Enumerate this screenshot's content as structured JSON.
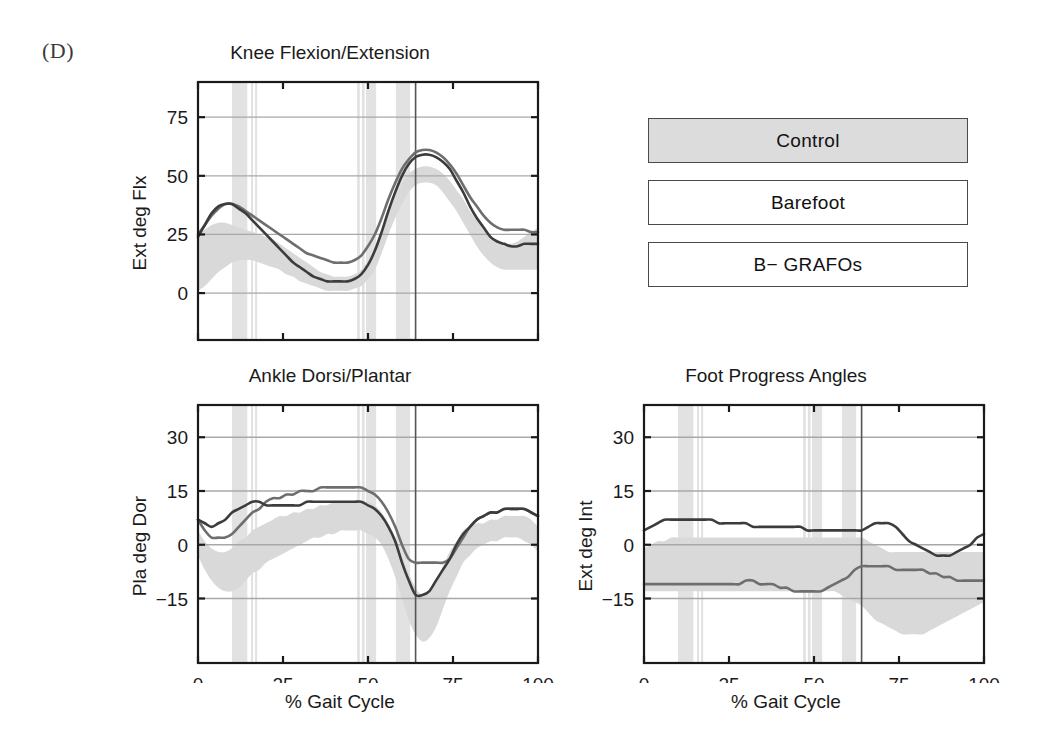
{
  "figure": {
    "panel_label": "(D)",
    "background": "#ffffff"
  },
  "legend": {
    "items": [
      {
        "label": "Control",
        "fill": "#dcdcdc",
        "border": "#4a4a4a"
      },
      {
        "label": "Barefoot",
        "fill": "#ffffff",
        "border": "#4a4a4a"
      },
      {
        "label": "B− GRAFOs",
        "fill": "#ffffff",
        "border": "#4a4a4a"
      }
    ]
  },
  "colors": {
    "band": "#d9d9d9",
    "event_band": "#e2e2e2",
    "series_barefoot": "#6e6e6e",
    "series_grafos": "#3c3c3c",
    "gridline": "#a8a8a8",
    "axis": "#1a1a1a",
    "toe_off_line": "#555555"
  },
  "chart_data": [
    {
      "id": "knee",
      "type": "line",
      "title": "Knee Flexion/Extension",
      "xlabel": "",
      "ylabel": "Ext   deg   Flx",
      "xlim": [
        0,
        100
      ],
      "ylim": [
        -20,
        90
      ],
      "yticks": [
        0,
        25,
        50,
        75
      ],
      "ytick_labels": [
        "0",
        "25",
        "50",
        "75"
      ],
      "xticks": [
        0,
        25,
        50,
        75,
        100
      ],
      "xtick_labels": [
        "",
        "",
        "",
        "",
        ""
      ],
      "grid": true,
      "legend_position": "external",
      "toe_off": 64,
      "event_bands": [
        {
          "from": 10.0,
          "to": 14.5
        },
        {
          "from": 15.6,
          "to": 16.2
        },
        {
          "from": 16.8,
          "to": 17.4
        },
        {
          "from": 46.8,
          "to": 47.6
        },
        {
          "from": 48.2,
          "to": 49.0
        },
        {
          "from": 49.4,
          "to": 52.4
        },
        {
          "from": 58.2,
          "to": 62.4
        }
      ],
      "x": [
        0,
        2,
        4,
        6,
        8,
        10,
        12,
        14,
        16,
        18,
        20,
        22,
        24,
        26,
        28,
        30,
        32,
        34,
        36,
        38,
        40,
        42,
        44,
        46,
        48,
        50,
        52,
        54,
        56,
        58,
        60,
        62,
        64,
        66,
        68,
        70,
        72,
        74,
        76,
        78,
        80,
        82,
        84,
        86,
        88,
        90,
        92,
        94,
        96,
        98,
        100
      ],
      "series": [
        {
          "name": "Control",
          "kind": "band",
          "upper": [
            25,
            27,
            29,
            30,
            30,
            29,
            28,
            27,
            26,
            25,
            24,
            23,
            21,
            19,
            17,
            15,
            13,
            11,
            9,
            8,
            7,
            7,
            7,
            8,
            10,
            14,
            19,
            26,
            34,
            41,
            47,
            51,
            53,
            54,
            54,
            53,
            51,
            48,
            44,
            40,
            35,
            31,
            27,
            24,
            22,
            21,
            21,
            22,
            24,
            26,
            28
          ],
          "lower": [
            1,
            3,
            6,
            9,
            11,
            13,
            14,
            14,
            14,
            13,
            12,
            11,
            10,
            8,
            7,
            5,
            4,
            3,
            2,
            1,
            1,
            1,
            1,
            2,
            3,
            6,
            10,
            17,
            25,
            32,
            38,
            43,
            46,
            47,
            47,
            46,
            43,
            39,
            35,
            30,
            25,
            20,
            16,
            13,
            11,
            10,
            10,
            10,
            10,
            10,
            10
          ]
        },
        {
          "name": "Barefoot",
          "kind": "line",
          "values": [
            25,
            29,
            33,
            36,
            38,
            38,
            37,
            35,
            33,
            31,
            29,
            27,
            25,
            23,
            21,
            19,
            17,
            16,
            15,
            14,
            13,
            13,
            13,
            14,
            16,
            20,
            25,
            32,
            40,
            47,
            53,
            57,
            60,
            61,
            61,
            60,
            58,
            55,
            51,
            46,
            41,
            37,
            33,
            30,
            28,
            27,
            27,
            27,
            27,
            26,
            26
          ]
        },
        {
          "name": "B− GRAFOs",
          "kind": "line",
          "values": [
            24,
            29,
            34,
            37,
            38,
            38,
            36,
            34,
            31,
            28,
            25,
            22,
            19,
            16,
            13,
            11,
            9,
            7,
            6,
            5,
            5,
            5,
            5,
            6,
            8,
            12,
            18,
            26,
            35,
            43,
            50,
            55,
            58,
            59,
            59,
            58,
            56,
            53,
            48,
            43,
            37,
            32,
            28,
            24,
            22,
            21,
            20,
            20,
            21,
            21,
            21
          ]
        }
      ]
    },
    {
      "id": "ankle",
      "type": "line",
      "title": "Ankle Dorsi/Plantar",
      "xlabel": "% Gait Cycle",
      "ylabel": "Pla   deg   Dor",
      "xlim": [
        0,
        100
      ],
      "ylim": [
        -33,
        39
      ],
      "yticks": [
        -15,
        0,
        15,
        30
      ],
      "ytick_labels": [
        "−15",
        "0",
        "15",
        "30"
      ],
      "xticks": [
        0,
        25,
        50,
        75,
        100
      ],
      "xtick_labels": [
        "0",
        "25",
        "50",
        "75",
        "100"
      ],
      "grid": true,
      "toe_off": 64,
      "event_bands": [
        {
          "from": 10.0,
          "to": 14.5
        },
        {
          "from": 15.6,
          "to": 16.2
        },
        {
          "from": 16.8,
          "to": 17.4
        },
        {
          "from": 46.8,
          "to": 47.6
        },
        {
          "from": 48.2,
          "to": 49.0
        },
        {
          "from": 49.4,
          "to": 52.4
        },
        {
          "from": 58.2,
          "to": 62.4
        }
      ],
      "x": [
        0,
        2,
        4,
        6,
        8,
        10,
        12,
        14,
        16,
        18,
        20,
        22,
        24,
        26,
        28,
        30,
        32,
        34,
        36,
        38,
        40,
        42,
        44,
        46,
        48,
        50,
        52,
        54,
        56,
        58,
        60,
        62,
        64,
        66,
        68,
        70,
        72,
        74,
        76,
        78,
        80,
        82,
        84,
        86,
        88,
        90,
        92,
        94,
        96,
        98,
        100
      ],
      "series": [
        {
          "name": "Control",
          "kind": "band",
          "upper": [
            4,
            1,
            -1,
            -2,
            -2,
            -1,
            1,
            2,
            4,
            5,
            6,
            7,
            8,
            8,
            9,
            9,
            10,
            10,
            11,
            11,
            12,
            12,
            12,
            12,
            12,
            12,
            11,
            9,
            6,
            2,
            -3,
            -8,
            -12,
            -14,
            -13,
            -10,
            -6,
            -2,
            1,
            4,
            5,
            6,
            6,
            7,
            7,
            8,
            8,
            8,
            8,
            7,
            5
          ],
          "lower": [
            -3,
            -7,
            -10,
            -12,
            -13,
            -13,
            -12,
            -10,
            -8,
            -7,
            -5,
            -4,
            -3,
            -2,
            -1,
            0,
            1,
            2,
            2,
            3,
            3,
            4,
            4,
            4,
            4,
            3,
            2,
            0,
            -4,
            -9,
            -15,
            -21,
            -25,
            -27,
            -26,
            -23,
            -18,
            -13,
            -9,
            -5,
            -3,
            -1,
            0,
            1,
            1,
            2,
            2,
            2,
            1,
            0,
            -2
          ]
        },
        {
          "name": "Barefoot",
          "kind": "line",
          "values": [
            7,
            4,
            2,
            2,
            2,
            3,
            5,
            7,
            9,
            10,
            12,
            13,
            13,
            14,
            14,
            15,
            15,
            15,
            16,
            16,
            16,
            16,
            16,
            16,
            16,
            15,
            14,
            12,
            9,
            5,
            0,
            -4,
            -5,
            -5,
            -5,
            -5,
            -5,
            -4,
            -1,
            2,
            5,
            7,
            8,
            9,
            9,
            10,
            10,
            10,
            10,
            9,
            8
          ]
        },
        {
          "name": "B− GRAFOs",
          "kind": "line",
          "values": [
            7,
            6,
            5,
            6,
            7,
            9,
            10,
            11,
            12,
            12,
            11,
            11,
            11,
            11,
            11,
            11,
            12,
            12,
            12,
            12,
            12,
            12,
            12,
            12,
            12,
            11,
            10,
            8,
            5,
            1,
            -5,
            -10,
            -14,
            -14,
            -13,
            -10,
            -7,
            -4,
            0,
            3,
            5,
            7,
            8,
            9,
            9,
            10,
            10,
            10,
            10,
            9,
            8
          ]
        }
      ]
    },
    {
      "id": "foot",
      "type": "line",
      "title": "Foot Progress Angles",
      "xlabel": "% Gait Cycle",
      "ylabel": "Ext   deg   Int",
      "xlim": [
        0,
        100
      ],
      "ylim": [
        -33,
        39
      ],
      "yticks": [
        -15,
        0,
        15,
        30
      ],
      "ytick_labels": [
        "−15",
        "0",
        "15",
        "30"
      ],
      "xticks": [
        0,
        25,
        50,
        75,
        100
      ],
      "xtick_labels": [
        "0",
        "25",
        "50",
        "75",
        "100"
      ],
      "grid": true,
      "toe_off": 64,
      "event_bands": [
        {
          "from": 10.0,
          "to": 14.5
        },
        {
          "from": 15.6,
          "to": 16.2
        },
        {
          "from": 16.8,
          "to": 17.4
        },
        {
          "from": 46.8,
          "to": 47.6
        },
        {
          "from": 48.2,
          "to": 49.0
        },
        {
          "from": 49.4,
          "to": 52.4
        },
        {
          "from": 58.2,
          "to": 62.4
        }
      ],
      "x": [
        0,
        2,
        4,
        6,
        8,
        10,
        12,
        14,
        16,
        18,
        20,
        22,
        24,
        26,
        28,
        30,
        32,
        34,
        36,
        38,
        40,
        42,
        44,
        46,
        48,
        50,
        52,
        54,
        56,
        58,
        60,
        62,
        64,
        66,
        68,
        70,
        72,
        74,
        76,
        78,
        80,
        82,
        84,
        86,
        88,
        90,
        92,
        94,
        96,
        98,
        100
      ],
      "series": [
        {
          "name": "Control",
          "kind": "band",
          "upper": [
            -1,
            0,
            1,
            1,
            2,
            2,
            2,
            2,
            2,
            2,
            2,
            2,
            2,
            2,
            2,
            2,
            2,
            2,
            2,
            2,
            2,
            2,
            2,
            2,
            2,
            2,
            2,
            2,
            2,
            2,
            2,
            2,
            2,
            1,
            0,
            -1,
            -2,
            -2,
            -2,
            -2,
            -2,
            -2,
            -2,
            -2,
            -2,
            -2,
            -2,
            -2,
            -2,
            -2,
            -2
          ],
          "lower": [
            -13,
            -13,
            -13,
            -13,
            -13,
            -13,
            -13,
            -13,
            -13,
            -13,
            -13,
            -13,
            -13,
            -13,
            -13,
            -13,
            -13,
            -13,
            -13,
            -13,
            -13,
            -13,
            -13,
            -13,
            -13,
            -13,
            -13,
            -13,
            -13,
            -14,
            -15,
            -16,
            -17,
            -19,
            -21,
            -22,
            -23,
            -24,
            -25,
            -25,
            -25,
            -25,
            -24,
            -23,
            -22,
            -21,
            -20,
            -19,
            -18,
            -17,
            -16
          ]
        },
        {
          "name": "B− GRAFOs",
          "kind": "line",
          "values": [
            4,
            5,
            6,
            7,
            7,
            7,
            7,
            7,
            7,
            7,
            7,
            6,
            6,
            6,
            6,
            6,
            5,
            5,
            5,
            5,
            5,
            5,
            5,
            5,
            4,
            4,
            4,
            4,
            4,
            4,
            4,
            4,
            4,
            5,
            6,
            6,
            6,
            5,
            3,
            1,
            0,
            -1,
            -2,
            -3,
            -3,
            -3,
            -2,
            -1,
            0,
            2,
            3
          ]
        },
        {
          "name": "Barefoot",
          "kind": "line",
          "values": [
            -11,
            -11,
            -11,
            -11,
            -11,
            -11,
            -11,
            -11,
            -11,
            -11,
            -11,
            -11,
            -11,
            -11,
            -11,
            -10,
            -10,
            -11,
            -11,
            -11,
            -12,
            -12,
            -13,
            -13,
            -13,
            -13,
            -13,
            -12,
            -11,
            -10,
            -9,
            -7,
            -6,
            -6,
            -6,
            -6,
            -6,
            -7,
            -7,
            -7,
            -7,
            -7,
            -8,
            -8,
            -9,
            -9,
            -10,
            -10,
            -10,
            -10,
            -10
          ]
        }
      ]
    }
  ]
}
